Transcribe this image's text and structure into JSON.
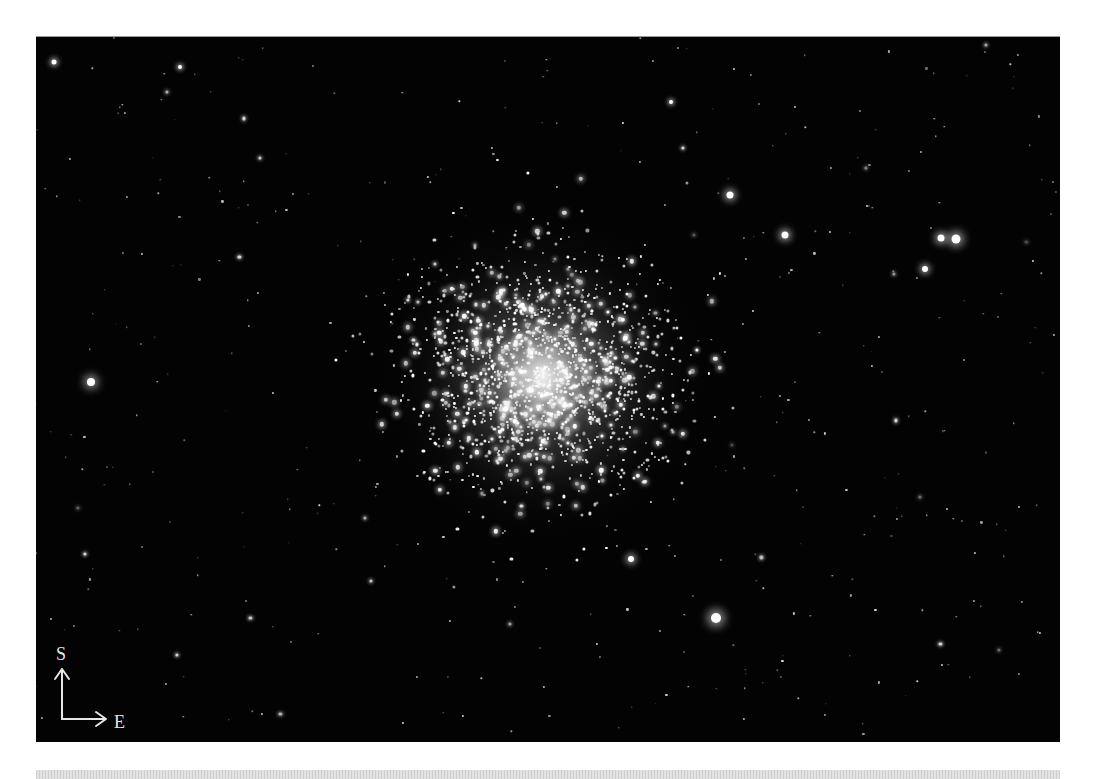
{
  "image": {
    "subject": "globular star cluster",
    "frame": {
      "left": 36,
      "top": 36,
      "width": 1024,
      "height": 705,
      "background": "#030303"
    },
    "cluster_center": {
      "x": 507,
      "y": 340
    },
    "colors": {
      "star": "#ffffff",
      "label": "#e6e6e6",
      "page": "#ffffff",
      "band": "#d8d8d8"
    }
  },
  "orientation": {
    "north_up_label": "S",
    "east_label": "E",
    "arrow_up": "up-arrow-icon",
    "arrow_right": "right-arrow-icon"
  },
  "bright_stars": [
    {
      "x": 55,
      "y": 345,
      "r": 4
    },
    {
      "x": 694,
      "y": 158,
      "r": 3.5
    },
    {
      "x": 749,
      "y": 198,
      "r": 3.5
    },
    {
      "x": 905,
      "y": 201,
      "r": 3.5
    },
    {
      "x": 920,
      "y": 202,
      "r": 4.5
    },
    {
      "x": 889,
      "y": 232,
      "r": 3
    },
    {
      "x": 680,
      "y": 581,
      "r": 5
    },
    {
      "x": 18,
      "y": 25,
      "r": 2.5
    },
    {
      "x": 144,
      "y": 30,
      "r": 2
    },
    {
      "x": 595,
      "y": 522,
      "r": 3
    },
    {
      "x": 635,
      "y": 65,
      "r": 2
    }
  ],
  "field": {
    "seed": 7,
    "count": 420,
    "cluster_count": 1600
  }
}
